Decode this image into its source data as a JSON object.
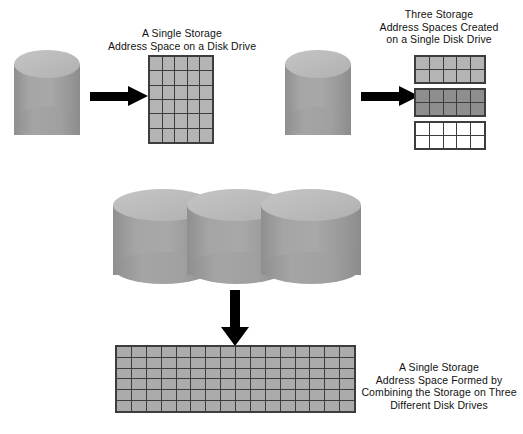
{
  "diagram": {
    "background_color": "#ffffff",
    "ink_color": "#000000",
    "cylinder_color": "#9d9d9d",
    "cylinder_top_color": "#bcbcbc",
    "grid_line_color": "#3d3d3d"
  },
  "panels": [
    {
      "id": "single-space-single-drive",
      "caption": "A Single Storage\nAddress Space on a Disk Drive",
      "caption_lines": [
        "A Single Storage",
        "Address Space on a Disk Drive"
      ],
      "drives": 1,
      "arrow": "right",
      "grids": [
        {
          "id": "grid-a",
          "columns": 5,
          "rows": 6,
          "shade": "#b4b4b4",
          "shade_name": "shade-light"
        }
      ]
    },
    {
      "id": "three-spaces-single-drive",
      "caption": "Three Storage\nAddress Spaces Created\non a Single Disk Drive",
      "caption_lines": [
        "Three Storage",
        "Address Spaces Created",
        "on a Single Disk Drive"
      ],
      "drives": 1,
      "arrow": "right",
      "grids": [
        {
          "id": "grid-b1",
          "columns": 5,
          "rows": 2,
          "shade": "#b4b4b4",
          "shade_name": "shade-light"
        },
        {
          "id": "grid-b2",
          "columns": 5,
          "rows": 2,
          "shade": "#8e8e8e",
          "shade_name": "shade-dark"
        },
        {
          "id": "grid-b3",
          "columns": 5,
          "rows": 2,
          "shade": "#ffffff",
          "shade_name": "shade-white"
        }
      ]
    },
    {
      "id": "single-space-three-drives",
      "caption": "A Single Storage\nAddress Space Formed by\nCombining the Storage on Three\nDifferent Disk Drives",
      "caption_lines": [
        "A Single Storage",
        "Address Space Formed by",
        "Combining the Storage on Three",
        "Different Disk Drives"
      ],
      "drives": 3,
      "arrow": "down",
      "grids": [
        {
          "id": "grid-c",
          "columns": 16,
          "rows": 6,
          "shade": "#ababab",
          "shade_name": "shade-mid"
        }
      ]
    }
  ]
}
